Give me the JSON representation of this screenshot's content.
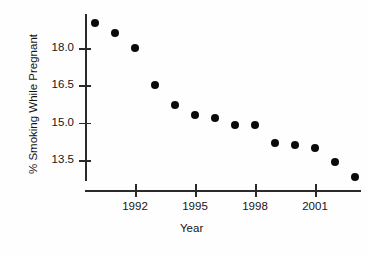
{
  "figure": {
    "clipped_title_fragment": "",
    "background_color": "#fefefe",
    "marker_color": "#0a0a0a",
    "axis_color": "#2a2a2a"
  },
  "chart_data": {
    "type": "scatter",
    "title": "",
    "xlabel": "Year",
    "ylabel": "% Smoking While Pregnant",
    "xlim": [
      1989.5,
      2003.8
    ],
    "ylim": [
      12.3,
      19.4
    ],
    "grid": false,
    "legend": null,
    "x_tick_labels": [
      "1992",
      "1995",
      "1998",
      "2001"
    ],
    "x_tick_values": [
      1992,
      1995,
      1998,
      2001
    ],
    "y_tick_labels": [
      "18.0",
      "16.5",
      "15.0",
      "13.5"
    ],
    "y_tick_values": [
      18.0,
      16.5,
      15.0,
      13.5
    ],
    "x": [
      1990,
      1991,
      1992,
      1993,
      1994,
      1995,
      1996,
      1997,
      1998,
      1999,
      2000,
      2001,
      2002,
      2003
    ],
    "values": [
      19.0,
      18.6,
      18.0,
      16.5,
      15.7,
      15.3,
      15.2,
      14.9,
      14.9,
      14.2,
      14.1,
      14.0,
      13.4,
      12.8
    ],
    "series": [
      {
        "name": "% Smoking While Pregnant",
        "values": [
          19.0,
          18.6,
          18.0,
          16.5,
          15.7,
          15.3,
          15.2,
          14.9,
          14.9,
          14.2,
          14.1,
          14.0,
          13.4,
          12.8
        ]
      }
    ]
  }
}
